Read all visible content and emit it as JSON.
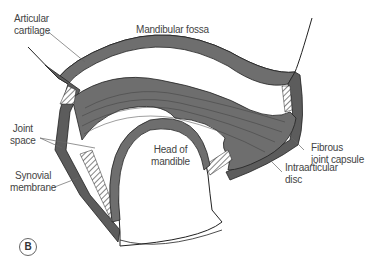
{
  "figure": {
    "panel_label": "B",
    "labels": {
      "articular_cartilage": "Articular\ncartilage",
      "mandibular_fossa": "Mandibular fossa",
      "joint_space": "Joint\nspace",
      "synovial_membrane": "Synovial\nmembrane",
      "head_of_mandible": "Head of\nmandible",
      "fibrous_joint_capsule": "Fibrous\njoint capsule",
      "intraarticular_disc": "Intraarticular\ndisc"
    },
    "colors": {
      "tissue": "#6e6e6e",
      "tissue_dark": "#555555",
      "outline": "#222222",
      "background": "#ffffff"
    }
  }
}
